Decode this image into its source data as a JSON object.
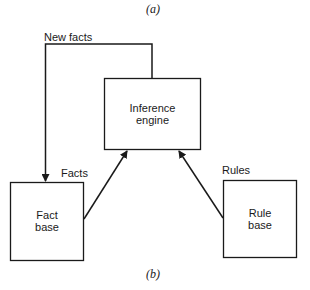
{
  "diagram": {
    "caption_top": "(a)",
    "caption_bottom": "(b)",
    "nodes": {
      "inference_engine": {
        "line1": "Inference",
        "line2": "engine"
      },
      "fact_base": {
        "line1": "Fact",
        "line2": "base"
      },
      "rule_base": {
        "line1": "Rule",
        "line2": "base"
      }
    },
    "edges": {
      "new_facts": "New facts",
      "facts": "Facts",
      "rules": "Rules"
    },
    "stroke_color": "#1a1a1a"
  }
}
